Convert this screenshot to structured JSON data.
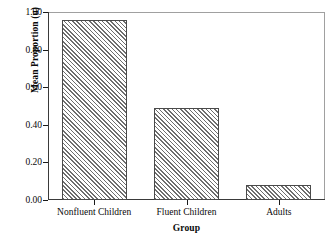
{
  "chart_data": {
    "type": "bar",
    "title": "",
    "subtitle": "",
    "xlabel": "Group",
    "ylabel": "Mean Proportion (u)",
    "categories": [
      "Nonfluent Children",
      "Fluent Children",
      "Adults"
    ],
    "values": [
      0.96,
      0.49,
      0.08
    ],
    "ylim": [
      0.0,
      1.0
    ],
    "yticks": [
      0.0,
      0.2,
      0.4,
      0.6,
      0.8,
      1.0
    ],
    "ytick_labels": [
      "0.00",
      "0.20",
      "0.40",
      "0.60",
      "0.80",
      "1.00"
    ],
    "grid": false,
    "legend": null,
    "legend_position": "none",
    "annotations": [],
    "bar_fill": "diagonal-hatch",
    "colors": {
      "bar_hatch": "#6e6e6e",
      "bar_background": "#ffffff",
      "bar_border": "#4a4a4a",
      "axis": "#3a3a3a",
      "frame": "#8c8c8c",
      "text": "#0a0a0a",
      "plot_background": "#ffffff"
    }
  }
}
